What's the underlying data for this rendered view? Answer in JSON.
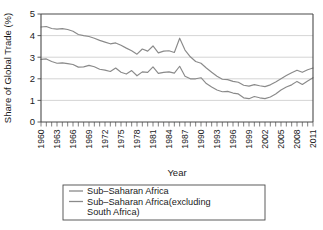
{
  "chart_data": {
    "type": "line",
    "title": "",
    "xlabel": "Year",
    "ylabel": "Share of Global Trade (%)",
    "xlim": [
      1960,
      2011
    ],
    "ylim": [
      0,
      5
    ],
    "yticks": [
      0,
      1,
      2,
      3,
      4,
      5
    ],
    "ytick_labels": [
      "0",
      "1",
      "2",
      "3",
      "4",
      "5"
    ],
    "xtick_labels": [
      "1960",
      "1963",
      "1966",
      "1969",
      "1972",
      "1975",
      "1978",
      "1981",
      "1984",
      "1987",
      "1990",
      "1993",
      "1996",
      "1999",
      "2002",
      "2005",
      "2008",
      "2011"
    ],
    "xtick_years": [
      1960,
      1963,
      1966,
      1969,
      1972,
      1975,
      1978,
      1981,
      1984,
      1987,
      1990,
      1993,
      1996,
      1999,
      2002,
      2005,
      2008,
      2011
    ],
    "minor_tick_interval": 1,
    "grid": "horizontal",
    "legend_position": "below-plot",
    "x": [
      1960,
      1961,
      1962,
      1963,
      1964,
      1965,
      1966,
      1967,
      1968,
      1969,
      1970,
      1971,
      1972,
      1973,
      1974,
      1975,
      1976,
      1977,
      1978,
      1979,
      1980,
      1981,
      1982,
      1983,
      1984,
      1985,
      1986,
      1987,
      1988,
      1989,
      1990,
      1991,
      1992,
      1993,
      1994,
      1995,
      1996,
      1997,
      1998,
      1999,
      2000,
      2001,
      2002,
      2003,
      2004,
      2005,
      2006,
      2007,
      2008,
      2009,
      2010,
      2011
    ],
    "series": [
      {
        "name": "Sub–Saharan Africa",
        "color": "#8a8a8a",
        "values": [
          4.4,
          4.42,
          4.33,
          4.3,
          4.32,
          4.28,
          4.2,
          4.05,
          4.0,
          3.96,
          3.88,
          3.78,
          3.7,
          3.62,
          3.66,
          3.55,
          3.42,
          3.3,
          3.14,
          3.38,
          3.28,
          3.52,
          3.2,
          3.28,
          3.3,
          3.22,
          3.88,
          3.33,
          3.02,
          2.8,
          2.72,
          2.5,
          2.3,
          2.12,
          1.98,
          1.96,
          1.88,
          1.84,
          1.7,
          1.66,
          1.73,
          1.68,
          1.64,
          1.72,
          1.85,
          2.0,
          2.15,
          2.28,
          2.4,
          2.3,
          2.42,
          2.5
        ]
      },
      {
        "name": "Sub–Saharan Africa(excluding South Africa)",
        "color": "#8a8a8a",
        "values": [
          2.9,
          2.92,
          2.8,
          2.72,
          2.74,
          2.7,
          2.66,
          2.54,
          2.55,
          2.62,
          2.56,
          2.44,
          2.4,
          2.34,
          2.5,
          2.3,
          2.22,
          2.38,
          2.14,
          2.32,
          2.3,
          2.55,
          2.25,
          2.3,
          2.32,
          2.26,
          2.58,
          2.12,
          2.0,
          2.0,
          2.05,
          1.78,
          1.62,
          1.48,
          1.4,
          1.42,
          1.34,
          1.3,
          1.12,
          1.08,
          1.18,
          1.12,
          1.08,
          1.16,
          1.3,
          1.48,
          1.62,
          1.72,
          1.88,
          1.74,
          1.9,
          2.05
        ]
      }
    ]
  },
  "legend": {
    "entries": [
      {
        "label": "Sub–Saharan Africa"
      },
      {
        "label": "Sub–Saharan Africa(excluding"
      },
      {
        "label": "South Africa)"
      }
    ]
  }
}
